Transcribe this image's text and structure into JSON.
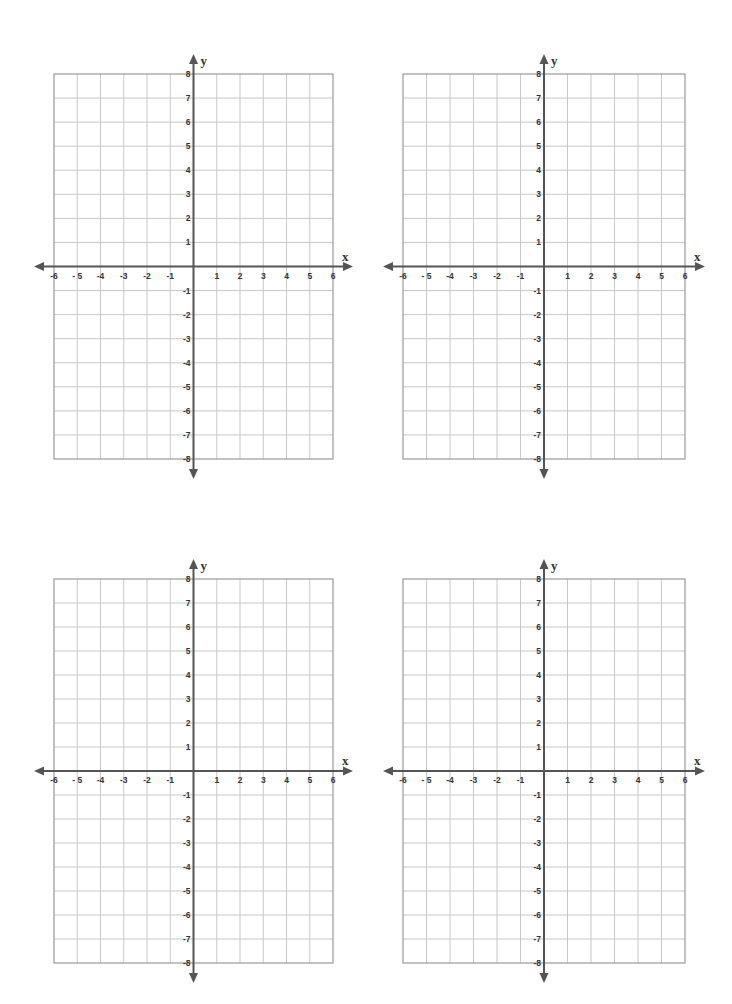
{
  "worksheet": {
    "title": "Coordinate Plane Worksheet",
    "colors": {
      "grid_line": "#c8c8c8",
      "border": "#9a9a9a",
      "axis": "#555555",
      "label": "#333333"
    },
    "planes": [
      {
        "id": "top-left",
        "left": 54,
        "top": 74,
        "width": 279,
        "height": 385
      },
      {
        "id": "top-right",
        "left": 403,
        "top": 74,
        "width": 282,
        "height": 385
      },
      {
        "id": "bottom-left",
        "left": 54,
        "top": 579,
        "width": 279,
        "height": 384
      },
      {
        "id": "bottom-right",
        "left": 403,
        "top": 579,
        "width": 282,
        "height": 384
      }
    ],
    "axes": {
      "x_label": "x",
      "y_label": "y",
      "x_min": -6,
      "x_max": 6,
      "y_min": -8,
      "y_max": 8,
      "x_tick_labels": [
        "-6",
        "- 5",
        "-4",
        "-3",
        "-2",
        "-1",
        "1",
        "2",
        "3",
        "4",
        "5",
        "6"
      ],
      "y_tick_labels": [
        "8",
        "7",
        "6",
        "5",
        "4",
        "3",
        "2",
        "1",
        "-1",
        "-2",
        "-3",
        "-4",
        "-5",
        "-6",
        "-7",
        "-8"
      ]
    }
  }
}
